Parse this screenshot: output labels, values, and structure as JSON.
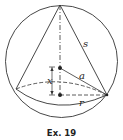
{
  "figure": {
    "caption": "Ex. 19",
    "labels": {
      "slant": "s",
      "center_to_base_edge": "a",
      "offset": "x",
      "radius": "r"
    }
  },
  "colors": {
    "stroke": "#333333",
    "background": "#ffffff"
  }
}
